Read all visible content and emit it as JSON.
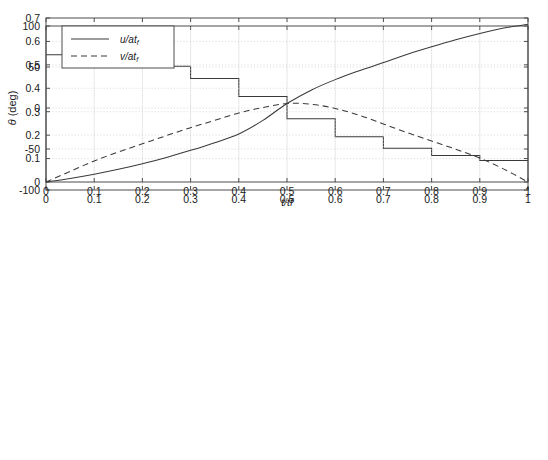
{
  "figure": {
    "background_color": "#ffffff",
    "axis_color": "#4d4d4d",
    "grid_color": "#c8c8c8",
    "line_color": "#3a3a3a",
    "tick_label_color": "#1a1a1a"
  },
  "caption": {
    "partial_text": ""
  },
  "chart_data": [
    {
      "id": "theta-plot",
      "type": "line",
      "subtype": "step",
      "title": "",
      "xlabel": "",
      "ylabel": "θ (deg)",
      "xlim": [
        0,
        1
      ],
      "ylim": [
        -100,
        100
      ],
      "xticks": [
        0,
        0.1,
        0.2,
        0.3,
        0.4,
        0.5,
        0.6,
        0.7,
        0.8,
        0.9,
        1
      ],
      "xticklabels": [
        "0",
        "0.1",
        "0.2",
        "0.3",
        "0.4",
        "0.5",
        "0.6",
        "0.7",
        "0.8",
        "0.9",
        "1"
      ],
      "yticks": [
        -100,
        -50,
        0,
        50,
        100
      ],
      "yticklabels": [
        "-100",
        "-50",
        "0",
        "50",
        "100"
      ],
      "grid": true,
      "legend": null,
      "series": [
        {
          "name": "theta",
          "style": "solid",
          "step_edges": [
            0,
            0.1,
            0.2,
            0.3,
            0.4,
            0.5,
            0.6,
            0.7,
            0.8,
            0.9,
            1
          ],
          "values": [
            65,
            59,
            51,
            36,
            14,
            -13,
            -35,
            -49,
            -58,
            -64
          ]
        }
      ]
    },
    {
      "id": "velocity-plot",
      "type": "line",
      "title": "",
      "xlabel": "t/tf",
      "ylabel": "",
      "xlim": [
        0,
        1
      ],
      "ylim": [
        0,
        0.7
      ],
      "xticks": [
        0,
        0.1,
        0.2,
        0.3,
        0.4,
        0.5,
        0.6,
        0.7,
        0.8,
        0.9,
        1
      ],
      "xticklabels": [
        "0",
        "0.1",
        "0.2",
        "0.3",
        "0.4",
        "0.5",
        "0.6",
        "0.7",
        "0.8",
        "0.9",
        "1"
      ],
      "yticks": [
        0,
        0.1,
        0.2,
        0.3,
        0.4,
        0.5,
        0.6,
        0.7
      ],
      "yticklabels": [
        "0",
        "0.1",
        "0.2",
        "0.3",
        "0.4",
        "0.5",
        "0.6",
        "0.7"
      ],
      "grid": true,
      "legend": {
        "position": "upper-left",
        "entries": [
          {
            "label": "u/at",
            "sub": "f",
            "style": "solid"
          },
          {
            "label": "v/at",
            "sub": "f",
            "style": "dashed"
          }
        ]
      },
      "x": [
        0,
        0.05,
        0.1,
        0.15,
        0.2,
        0.25,
        0.3,
        0.35,
        0.4,
        0.45,
        0.5,
        0.55,
        0.6,
        0.65,
        0.7,
        0.75,
        0.8,
        0.85,
        0.9,
        0.95,
        1
      ],
      "series": [
        {
          "name": "u/at_f",
          "style": "solid",
          "values": [
            0.0,
            0.015,
            0.033,
            0.054,
            0.078,
            0.105,
            0.135,
            0.168,
            0.205,
            0.263,
            0.335,
            0.392,
            0.437,
            0.475,
            0.51,
            0.545,
            0.577,
            0.607,
            0.634,
            0.657,
            0.673
          ]
        },
        {
          "name": "v/at_f",
          "style": "dashed",
          "values": [
            0.0,
            0.045,
            0.09,
            0.128,
            0.163,
            0.198,
            0.232,
            0.263,
            0.295,
            0.318,
            0.335,
            0.332,
            0.314,
            0.285,
            0.248,
            0.21,
            0.175,
            0.14,
            0.102,
            0.055,
            0.0
          ]
        }
      ]
    }
  ]
}
